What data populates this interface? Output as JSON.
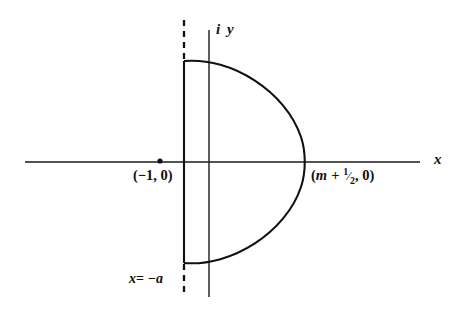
{
  "figure": {
    "background_color": "#ffffff",
    "line_color": "#111111",
    "axis_color": "#1a1a1a",
    "width": 465,
    "height": 315
  },
  "axes": {
    "horizontal": {
      "label": "x",
      "y_pixel": 162,
      "x_start": 25,
      "x_end": 420
    },
    "vertical": {
      "label": "i y",
      "x_pixel": 209,
      "y_start": 30,
      "y_end": 297
    },
    "origin": {
      "x": 209,
      "y": 162
    }
  },
  "markers": [
    {
      "name": "pole-at-minus-one",
      "label": "(−1, 0)",
      "x_pixel": 160,
      "y_pixel": 161
    }
  ],
  "annotations": {
    "right_crossing": {
      "prefix": "(",
      "variable": "m",
      "operator": "+",
      "fraction_numerator": "1",
      "fraction_denominator": "2",
      "suffix": ", 0)",
      "full_text": "(m + 1/2, 0)"
    },
    "dashed_line": {
      "variable": "x",
      "equals": "=",
      "value": "−a",
      "full_text": "x = −a"
    }
  },
  "contour": {
    "type": "semicircle-with-vertical-chord",
    "vertical_segment": {
      "x_pixel": 184,
      "y_top": 61,
      "y_bottom": 263
    },
    "arc": {
      "top_point": {
        "x": 184,
        "y": 61
      },
      "apex": {
        "x": 212,
        "y": 59
      },
      "right_crossing": {
        "x": 305,
        "y": 162
      },
      "bottom_point": {
        "x": 184,
        "y": 263
      }
    }
  },
  "dashed_segments": [
    {
      "name": "upper",
      "x_pixel": 184,
      "y_start": 20,
      "y_end": 61
    },
    {
      "name": "lower",
      "x_pixel": 184,
      "y_start": 263,
      "y_end": 297
    }
  ]
}
